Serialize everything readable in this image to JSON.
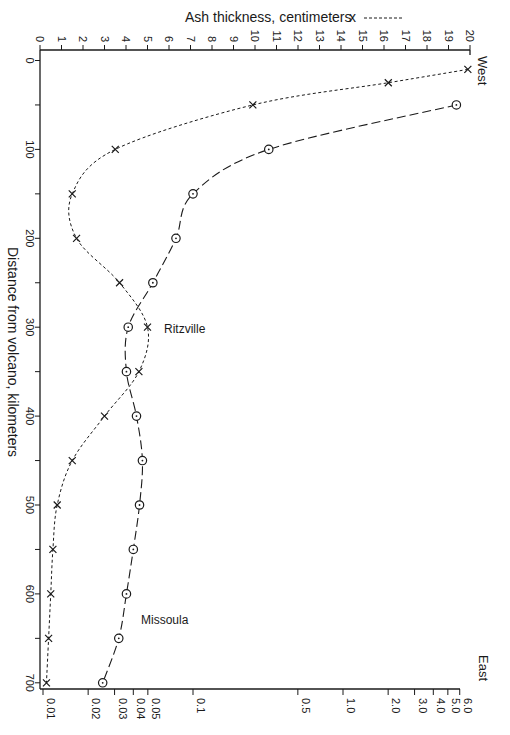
{
  "legend": {
    "label": "Ash thickness, centimeters",
    "marker": "x",
    "line": "-------"
  },
  "labels": {
    "west": "West",
    "east": "East",
    "ylabel": "Distance from volcano, kilometers",
    "ritzville": "Ritzville",
    "missoula": "Missoula"
  },
  "chart_data": {
    "type": "line",
    "title": "",
    "orientation": "rotated (distance on vertical axis, increasing downward)",
    "ylabel": "Distance from volcano, kilometers",
    "y_ticks": [
      0,
      100,
      200,
      300,
      400,
      500,
      600,
      700
    ],
    "ylim": [
      0,
      700
    ],
    "top_axis": {
      "label": "Ash thickness, centimeters",
      "scale": "linear",
      "range": [
        0,
        20
      ],
      "ticks": [
        "0",
        "1",
        "2",
        "3",
        "4",
        "5",
        "6",
        "7",
        "8",
        "9",
        "10",
        "11",
        "12",
        "13",
        "14",
        "15",
        "16",
        "17",
        "18",
        "19",
        "20"
      ]
    },
    "bottom_axis": {
      "label": "",
      "scale": "log",
      "range": [
        0.01,
        6.0
      ],
      "ticks": [
        "0.01",
        "0.02",
        "0.03",
        "0.04",
        "0.05",
        "0.1",
        "0.5",
        "1.0",
        "2.0",
        "3.0",
        "4.0",
        "5.0",
        "6.0"
      ]
    },
    "annotations": [
      {
        "text": "West",
        "position": "top-right"
      },
      {
        "text": "East",
        "position": "bottom-right"
      },
      {
        "text": "Ritzville",
        "distance_km": 300
      },
      {
        "text": "Missoula",
        "distance_km": 650
      }
    ],
    "grid": false,
    "series": [
      {
        "name": "Ash thickness, centimeters",
        "marker": "x",
        "line": "short-dash",
        "axis": "top",
        "distance_km": [
          10,
          25,
          50,
          100,
          150,
          200,
          250,
          300,
          350,
          400,
          450,
          500,
          550,
          600,
          650,
          700
        ],
        "values": [
          19.9,
          16.2,
          9.9,
          3.5,
          1.5,
          1.7,
          3.7,
          5.0,
          4.6,
          3.0,
          1.5,
          0.8,
          0.6,
          0.5,
          0.4,
          0.3
        ]
      },
      {
        "name": "circle series (bottom log axis)",
        "marker": "circle-dot",
        "line": "long-dash",
        "axis": "bottom",
        "distance_km": [
          50,
          100,
          150,
          200,
          250,
          300,
          350,
          400,
          450,
          500,
          550,
          600,
          650,
          700
        ],
        "values": [
          5.7,
          0.32,
          0.1,
          0.077,
          0.054,
          0.037,
          0.036,
          0.042,
          0.046,
          0.044,
          0.04,
          0.036,
          0.032,
          0.025
        ]
      }
    ]
  }
}
